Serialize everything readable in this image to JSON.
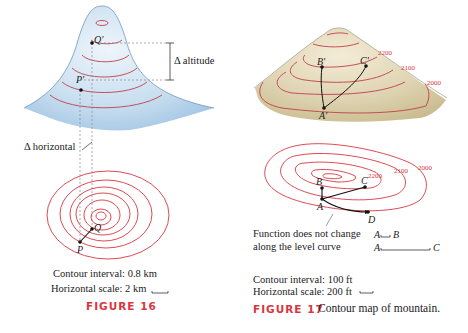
{
  "figure16": {
    "labels": {
      "q_prime": "Q′",
      "p_prime": "P′",
      "q": "Q",
      "p": "P",
      "delta_altitude": "Δ altitude",
      "delta_horizontal": "Δ horizontal"
    },
    "contour_interval": "Contour interval: 0.8 km",
    "horizontal_scale": "Horizontal scale: 2 km",
    "caption_label": "FIGURE 16",
    "colors": {
      "contour": "#d9363e",
      "mountain": "#bcd6ec"
    }
  },
  "figure17": {
    "labels": {
      "a_prime": "A′",
      "b_prime": "B′",
      "c_prime": "C′",
      "a": "A",
      "b": "B",
      "c": "C",
      "d": "D"
    },
    "elevation_labels_3d": [
      "2200",
      "2100",
      "2000"
    ],
    "elevation_labels_map": [
      "2200",
      "2100",
      "2000"
    ],
    "annotation_line1": "Function does not change",
    "annotation_line2": "along the level curve",
    "scale_ab_from": "A",
    "scale_ab_to": "B",
    "scale_ac_from": "A",
    "scale_ac_to": "C",
    "contour_interval": "Contour interval: 100 ft",
    "horizontal_scale": "Horizontal scale: 200 ft",
    "caption_label": "FIGURE 17",
    "caption_text": "Contour map of mountain.",
    "colors": {
      "contour": "#d9363e",
      "mountain": "#d8ceab"
    }
  }
}
